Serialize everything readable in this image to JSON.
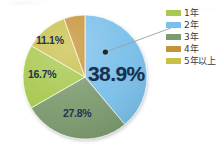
{
  "chart_data": {
    "type": "pie",
    "title": "",
    "subtitle": "",
    "xlabel": "",
    "ylabel": "",
    "legend_position": "right",
    "grid": false,
    "units": "percent",
    "start_angle_deg": 0,
    "direction": "clockwise",
    "categories": [
      "1年",
      "2年",
      "3年",
      "4年",
      "5年以上"
    ],
    "values": [
      16.7,
      38.9,
      27.8,
      5.5,
      11.1
    ],
    "colors": [
      "#a8c84f",
      "#7bc0ea",
      "#7d9b70",
      "#c79236",
      "#c9c04a"
    ],
    "slices": [
      {
        "label": "2年",
        "value": 38.9,
        "display": "38.9%",
        "color": "#7bc0ea",
        "label_shown": true,
        "emphasis": true,
        "callout": true
      },
      {
        "label": "3年",
        "value": 27.8,
        "display": "27.8%",
        "color": "#7d9b70",
        "label_shown": true,
        "emphasis": false,
        "callout": false
      },
      {
        "label": "1年",
        "value": 16.7,
        "display": "16.7%",
        "color": "#a8c84f",
        "label_shown": true,
        "emphasis": false,
        "callout": false
      },
      {
        "label": "5年以上",
        "value": 11.1,
        "display": "11.1%",
        "color": "#c9c04a",
        "label_shown": true,
        "emphasis": false,
        "callout": false
      },
      {
        "label": "4年",
        "value": 5.5,
        "display": "",
        "color": "#c79236",
        "label_shown": false,
        "emphasis": false,
        "callout": false
      }
    ],
    "callout": {
      "target_slice": "2年",
      "dot_color": "#22262b",
      "line_color": "#9aa0a6"
    }
  },
  "legend": {
    "items": [
      {
        "label": "1年",
        "color": "#a8c84f",
        "swatch_name": "legend-swatch-1nen"
      },
      {
        "label": "2年",
        "color": "#7bc0ea",
        "swatch_name": "legend-swatch-2nen"
      },
      {
        "label": "3年",
        "color": "#7d9b70",
        "swatch_name": "legend-swatch-3nen"
      },
      {
        "label": "4年",
        "color": "#c79236",
        "swatch_name": "legend-swatch-4nen"
      },
      {
        "label": "5年以上",
        "color": "#c9c04a",
        "swatch_name": "legend-swatch-5nen-ijo"
      }
    ]
  },
  "labels": {
    "featured": "38.9%",
    "green_gray": "27.8%",
    "green_bright": "16.7%",
    "khaki": "11.1%"
  },
  "colors": {
    "background": "#ffffff",
    "label_text": "#17304e",
    "legend_text": "#3b3b39",
    "callout_line": "#9aa0a6",
    "callout_dot": "#22262b"
  }
}
